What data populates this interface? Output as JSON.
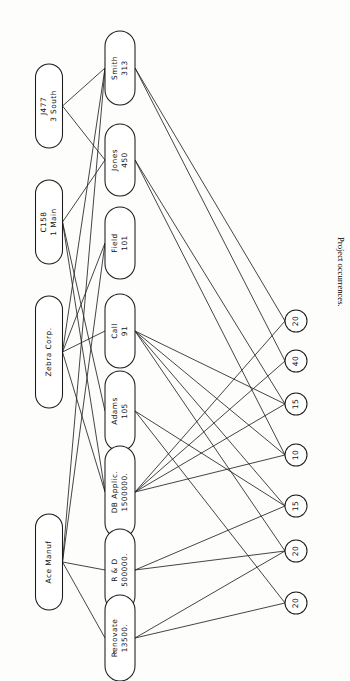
{
  "figure": {
    "caption_number": "Fig. 9.6",
    "caption_text": "Project occurrences.",
    "orientation": "rotated-90",
    "ink_color": "#1b1b1b",
    "background_color": "#fdfdfc"
  },
  "diagram": {
    "type": "network-graph",
    "columns": [
      {
        "name": "customers",
        "count": 4
      },
      {
        "name": "records",
        "count": 8
      },
      {
        "name": "occurrences",
        "count": 7
      }
    ],
    "customers": [
      {
        "id": "c0",
        "line1": "J477",
        "line2": "3 South"
      },
      {
        "id": "c1",
        "line1": "C158",
        "line2": "1 Main"
      },
      {
        "id": "c2",
        "line1": "Zebra Corp.",
        "line2": ""
      },
      {
        "id": "c3",
        "line1": "Ace Manuf",
        "line2": ""
      }
    ],
    "records": [
      {
        "id": "r0",
        "line1": "Smith",
        "line2": "313"
      },
      {
        "id": "r1",
        "line1": "Jones",
        "line2": "450"
      },
      {
        "id": "r2",
        "line1": "Field",
        "line2": "101"
      },
      {
        "id": "r3",
        "line1": "Call",
        "line2": "91"
      },
      {
        "id": "r4",
        "line1": "Adams",
        "line2": "105"
      },
      {
        "id": "r5",
        "line1": "DB Applic.",
        "line2": "1500000."
      },
      {
        "id": "r6",
        "line1": "R & D",
        "line2": "500000."
      },
      {
        "id": "r7",
        "line1": "Renovate",
        "line2": "13500."
      }
    ],
    "occurrences": [
      {
        "id": "o0",
        "value": "20"
      },
      {
        "id": "o1",
        "value": "40"
      },
      {
        "id": "o2",
        "value": "15"
      },
      {
        "id": "o3",
        "value": "10"
      },
      {
        "id": "o4",
        "value": "15"
      },
      {
        "id": "o5",
        "value": "20"
      },
      {
        "id": "o6",
        "value": "20"
      }
    ],
    "edges_customer_record": [
      [
        "c0",
        "r0"
      ],
      [
        "c0",
        "r1"
      ],
      [
        "c1",
        "r1"
      ],
      [
        "c1",
        "r4"
      ],
      [
        "c1",
        "r5"
      ],
      [
        "c2",
        "r0"
      ],
      [
        "c2",
        "r2"
      ],
      [
        "c2",
        "r3"
      ],
      [
        "c2",
        "r5"
      ],
      [
        "c3",
        "r0"
      ],
      [
        "c3",
        "r2"
      ],
      [
        "c3",
        "r6"
      ],
      [
        "c3",
        "r7"
      ]
    ],
    "edges_record_occurrence": [
      [
        "r0",
        "o0"
      ],
      [
        "r0",
        "o1"
      ],
      [
        "r1",
        "o2"
      ],
      [
        "r1",
        "o3"
      ],
      [
        "r3",
        "o2"
      ],
      [
        "r3",
        "o3"
      ],
      [
        "r3",
        "o4"
      ],
      [
        "r3",
        "o5"
      ],
      [
        "r4",
        "o4"
      ],
      [
        "r4",
        "o6"
      ],
      [
        "r5",
        "o0"
      ],
      [
        "r5",
        "o1"
      ],
      [
        "r5",
        "o2"
      ],
      [
        "r5",
        "o3"
      ],
      [
        "r6",
        "o4"
      ],
      [
        "r6",
        "o5"
      ],
      [
        "r7",
        "o5"
      ],
      [
        "r7",
        "o6"
      ]
    ]
  }
}
